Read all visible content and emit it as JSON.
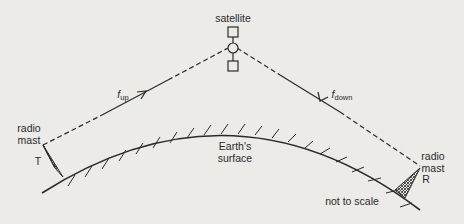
{
  "diagram": {
    "satellite_label": "satellite",
    "uplink_label": {
      "symbol": "f",
      "subscript": "up"
    },
    "downlink_label": {
      "symbol": "f",
      "subscript": "down"
    },
    "transmitter": {
      "line1": "radio",
      "line2": "mast",
      "letter": "T"
    },
    "receiver": {
      "line1": "radio",
      "line2": "mast",
      "letter": "R"
    },
    "surface_label_1": "Earth's",
    "surface_label_2": "surface",
    "scale_note": "not to scale",
    "colors": {
      "background": "#ecebe8",
      "ink": "#2a2a2a"
    }
  }
}
